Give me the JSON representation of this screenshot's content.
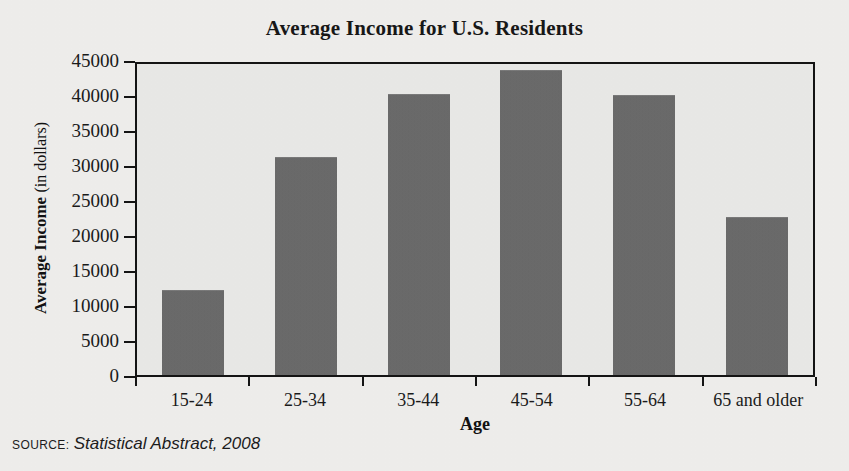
{
  "chart_data": {
    "type": "bar",
    "title": "Average Income for U.S. Residents",
    "xlabel": "Age",
    "ylabel": "Average Income (in dollars)",
    "ylabel_bold_part": "Average Income",
    "ylabel_light_part": "(in dollars)",
    "categories": [
      "15-24",
      "25-34",
      "35-44",
      "45-54",
      "55-64",
      "65 and older"
    ],
    "values": [
      12000,
      31000,
      40000,
      43500,
      39800,
      22500
    ],
    "ylim": [
      0,
      45000
    ],
    "ytick_labels": [
      "45000",
      "40000",
      "35000",
      "30000",
      "25000",
      "20000",
      "15000",
      "10000",
      "5000",
      "0"
    ],
    "ytick_values": [
      45000,
      40000,
      35000,
      30000,
      25000,
      20000,
      15000,
      10000,
      5000,
      0
    ],
    "grid": false,
    "legend": "none",
    "bar_color": "#6a6a6a",
    "plot_background": "#e9e9e7",
    "axis_color": "#141414"
  },
  "source": {
    "kicker": "SOURCE:",
    "reference": "Statistical Abstract, 2008"
  }
}
